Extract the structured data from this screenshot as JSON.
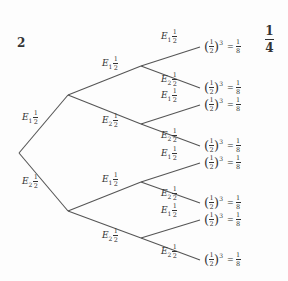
{
  "question_number": "2",
  "answer": {
    "numerator": "1",
    "denominator": "4"
  },
  "line_color": "#555555",
  "branches": [
    {
      "id": "r-a",
      "event": "E",
      "sub": "1",
      "num": "1",
      "den": "2",
      "x": 22,
      "y": 118
    },
    {
      "id": "r-b",
      "event": "E",
      "sub": "2",
      "num": "1",
      "den": "2",
      "x": 22,
      "y": 182
    },
    {
      "id": "a-c",
      "event": "E",
      "sub": "1",
      "num": "1",
      "den": "2",
      "x": 102,
      "y": 64
    },
    {
      "id": "a-d",
      "event": "E",
      "sub": "2",
      "num": "1",
      "den": "2",
      "x": 102,
      "y": 121
    },
    {
      "id": "b-e",
      "event": "E",
      "sub": "1",
      "num": "1",
      "den": "2",
      "x": 102,
      "y": 180
    },
    {
      "id": "b-f",
      "event": "E",
      "sub": "2",
      "num": "1",
      "den": "2",
      "x": 102,
      "y": 236
    },
    {
      "id": "c-1",
      "event": "E",
      "sub": "1",
      "num": "1",
      "den": "2",
      "x": 161,
      "y": 37
    },
    {
      "id": "c-2",
      "event": "E",
      "sub": "2",
      "num": "1",
      "den": "2",
      "x": 161,
      "y": 80
    },
    {
      "id": "d-3",
      "event": "E",
      "sub": "1",
      "num": "1",
      "den": "2",
      "x": 161,
      "y": 96
    },
    {
      "id": "d-4",
      "event": "E",
      "sub": "2",
      "num": "1",
      "den": "2",
      "x": 161,
      "y": 136
    },
    {
      "id": "e-5",
      "event": "E",
      "sub": "1",
      "num": "1",
      "den": "2",
      "x": 161,
      "y": 154
    },
    {
      "id": "e-6",
      "event": "E",
      "sub": "2",
      "num": "1",
      "den": "2",
      "x": 161,
      "y": 194
    },
    {
      "id": "f-7",
      "event": "E",
      "sub": "1",
      "num": "1",
      "den": "2",
      "x": 161,
      "y": 211
    },
    {
      "id": "f-8",
      "event": "E",
      "sub": "2",
      "num": "1",
      "den": "2",
      "x": 161,
      "y": 252
    }
  ],
  "leaves": [
    {
      "y": 47,
      "base_num": "1",
      "base_den": "2",
      "exp": "3",
      "eq": "=",
      "res_num": "1",
      "res_den": "8"
    },
    {
      "y": 88,
      "base_num": "1",
      "base_den": "2",
      "exp": "3",
      "eq": "=",
      "res_num": "1",
      "res_den": "8"
    },
    {
      "y": 105,
      "base_num": "1",
      "base_den": "2",
      "exp": "3",
      "eq": "=",
      "res_num": "1",
      "res_den": "8"
    },
    {
      "y": 146,
      "base_num": "1",
      "base_den": "2",
      "exp": "3",
      "eq": "=",
      "res_num": "1",
      "res_den": "8"
    },
    {
      "y": 163,
      "base_num": "1",
      "base_den": "2",
      "exp": "3",
      "eq": "=",
      "res_num": "1",
      "res_den": "8"
    },
    {
      "y": 203,
      "base_num": "1",
      "base_den": "2",
      "exp": "3",
      "eq": "=",
      "res_num": "1",
      "res_den": "8"
    },
    {
      "y": 220,
      "base_num": "1",
      "base_den": "2",
      "exp": "3",
      "eq": "=",
      "res_num": "1",
      "res_den": "8"
    },
    {
      "y": 260,
      "base_num": "1",
      "base_den": "2",
      "exp": "3",
      "eq": "=",
      "res_num": "1",
      "res_den": "8"
    }
  ],
  "nodes": {
    "root": [
      19,
      153
    ],
    "l1": [
      [
        68,
        95
      ],
      [
        68,
        211
      ]
    ],
    "l2": [
      [
        141,
        66
      ],
      [
        141,
        124
      ],
      [
        141,
        182
      ],
      [
        141,
        238
      ]
    ],
    "leaf_x": 200
  }
}
